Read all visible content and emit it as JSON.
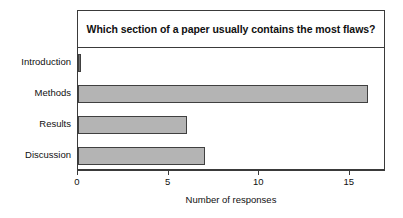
{
  "chart_data": {
    "type": "bar",
    "orientation": "horizontal",
    "title": "Which section of a paper usually contains the most flaws?",
    "xlabel": "Number of responses",
    "ylabel": "",
    "categories": [
      "Introduction",
      "Methods",
      "Results",
      "Discussion"
    ],
    "values": [
      0,
      16,
      6,
      7
    ],
    "xlim": [
      0,
      17
    ],
    "xticks": [
      0,
      5,
      10,
      15
    ],
    "xtick_labels": [
      "0",
      "5",
      "10",
      "15"
    ],
    "grid": false,
    "legend": false,
    "bar_fill_color": "#b4b4b4",
    "bar_edge_color": "#404040",
    "frame_color": "#3a3a3a",
    "background_color": "#ffffff"
  }
}
